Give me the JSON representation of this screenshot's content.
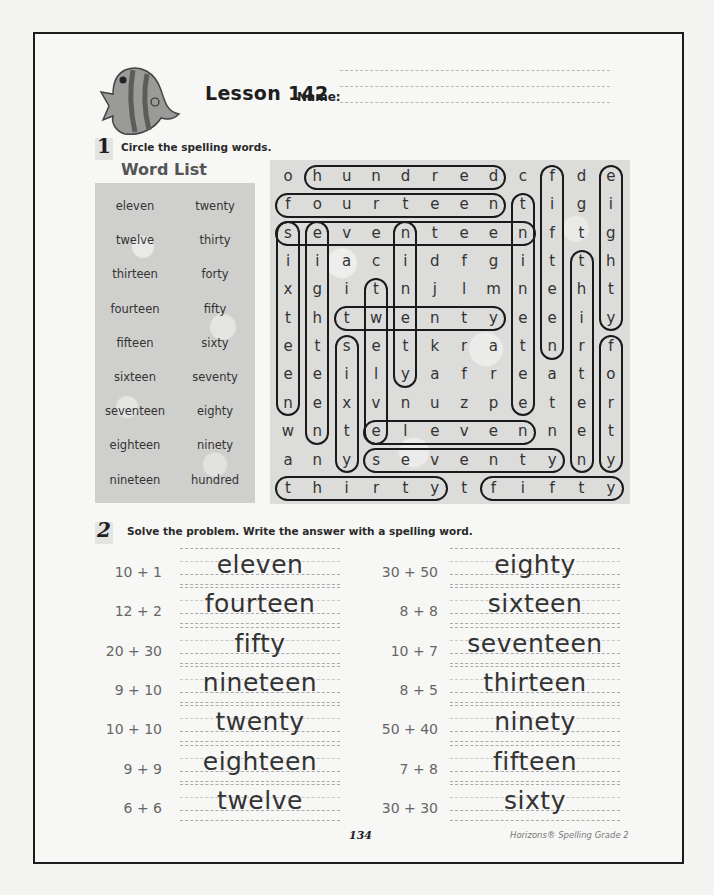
{
  "header": {
    "lesson_title": "Lesson 142",
    "name_label": "Name:",
    "mascot": "fish-icon"
  },
  "section1": {
    "number": "1",
    "instruction": "Circle the spelling words.",
    "word_list_title": "Word List",
    "word_list": [
      [
        "eleven",
        "twenty"
      ],
      [
        "twelve",
        "thirty"
      ],
      [
        "thirteen",
        "forty"
      ],
      [
        "fourteen",
        "fifty"
      ],
      [
        "fifteen",
        "sixty"
      ],
      [
        "sixteen",
        "seventy"
      ],
      [
        "seventeen",
        "eighty"
      ],
      [
        "eighteen",
        "ninety"
      ],
      [
        "nineteen",
        "hundred"
      ]
    ],
    "grid": [
      [
        "o",
        "h",
        "u",
        "n",
        "d",
        "r",
        "e",
        "d",
        "c",
        "f",
        "d",
        "e"
      ],
      [
        "f",
        "o",
        "u",
        "r",
        "t",
        "e",
        "e",
        "n",
        "t",
        "i",
        "g",
        "i"
      ],
      [
        "s",
        "e",
        "v",
        "e",
        "n",
        "t",
        "e",
        "e",
        "n",
        "f",
        "t",
        "g"
      ],
      [
        "i",
        "i",
        "a",
        "c",
        "i",
        "d",
        "f",
        "g",
        "i",
        "t",
        "t",
        "h"
      ],
      [
        "x",
        "g",
        "i",
        "t",
        "n",
        "j",
        "l",
        "m",
        "n",
        "e",
        "h",
        "t"
      ],
      [
        "t",
        "h",
        "t",
        "w",
        "e",
        "n",
        "t",
        "y",
        "e",
        "e",
        "i",
        "y"
      ],
      [
        "e",
        "t",
        "s",
        "e",
        "t",
        "k",
        "r",
        "a",
        "t",
        "n",
        "r",
        "f"
      ],
      [
        "e",
        "e",
        "i",
        "l",
        "y",
        "a",
        "f",
        "r",
        "e",
        "a",
        "t",
        "o"
      ],
      [
        "n",
        "e",
        "x",
        "v",
        "n",
        "u",
        "z",
        "p",
        "e",
        "t",
        "e",
        "r"
      ],
      [
        "w",
        "n",
        "t",
        "e",
        "l",
        "e",
        "v",
        "e",
        "n",
        "n",
        "e",
        "t"
      ],
      [
        "a",
        "n",
        "y",
        "s",
        "e",
        "v",
        "e",
        "n",
        "t",
        "y",
        "n",
        "y"
      ],
      [
        "t",
        "h",
        "i",
        "r",
        "t",
        "y",
        "t",
        "f",
        "i",
        "f",
        "t",
        "y"
      ]
    ],
    "circled_words": [
      {
        "word": "hundred",
        "dir": "h",
        "row": 0,
        "start": 1,
        "end": 7
      },
      {
        "word": "fourteen",
        "dir": "h",
        "row": 1,
        "start": 0,
        "end": 7
      },
      {
        "word": "seventeen",
        "dir": "h",
        "row": 2,
        "start": 0,
        "end": 8
      },
      {
        "word": "twenty",
        "dir": "h",
        "row": 5,
        "start": 2,
        "end": 7
      },
      {
        "word": "eleven",
        "dir": "h",
        "row": 9,
        "start": 3,
        "end": 8
      },
      {
        "word": "seventy",
        "dir": "h",
        "row": 10,
        "start": 3,
        "end": 9
      },
      {
        "word": "thirty",
        "dir": "h",
        "row": 11,
        "start": 0,
        "end": 5
      },
      {
        "word": "fifty",
        "dir": "h",
        "row": 11,
        "start": 7,
        "end": 11
      },
      {
        "word": "sixteen",
        "dir": "v",
        "col": 0,
        "start": 2,
        "end": 8
      },
      {
        "word": "eighteen",
        "dir": "v",
        "col": 1,
        "start": 2,
        "end": 9
      },
      {
        "word": "sixty",
        "dir": "v",
        "col": 2,
        "start": 6,
        "end": 10
      },
      {
        "word": "twelve",
        "dir": "v",
        "col": 3,
        "start": 4,
        "end": 9
      },
      {
        "word": "ninety",
        "dir": "v",
        "col": 4,
        "start": 2,
        "end": 7
      },
      {
        "word": "nineteen",
        "dir": "v",
        "col": 8,
        "start": 1,
        "end": 8
      },
      {
        "word": "fifteen",
        "dir": "v",
        "col": 9,
        "start": 0,
        "end": 6
      },
      {
        "word": "thirteen",
        "dir": "v",
        "col": 10,
        "start": 3,
        "end": 10
      },
      {
        "word": "eighty",
        "dir": "v",
        "col": 11,
        "start": 0,
        "end": 5
      },
      {
        "word": "forty",
        "dir": "v",
        "col": 11,
        "start": 6,
        "end": 10
      }
    ]
  },
  "section2": {
    "number": "2",
    "instruction": "Solve the problem. Write the answer with a spelling word.",
    "left": [
      {
        "problem": "10 + 1",
        "answer": "eleven"
      },
      {
        "problem": "12 + 2",
        "answer": "fourteen"
      },
      {
        "problem": "20 + 30",
        "answer": "fifty"
      },
      {
        "problem": "9 + 10",
        "answer": "nineteen"
      },
      {
        "problem": "10 + 10",
        "answer": "twenty"
      },
      {
        "problem": "9 + 9",
        "answer": "eighteen"
      },
      {
        "problem": "6 + 6",
        "answer": "twelve"
      }
    ],
    "right": [
      {
        "problem": "30 + 50",
        "answer": "eighty"
      },
      {
        "problem": "8 + 8",
        "answer": "sixteen"
      },
      {
        "problem": "10 + 7",
        "answer": "seventeen"
      },
      {
        "problem": "8 + 5",
        "answer": "thirteen"
      },
      {
        "problem": "50 + 40",
        "answer": "ninety"
      },
      {
        "problem": "7 + 8",
        "answer": "fifteen"
      },
      {
        "problem": "30 + 30",
        "answer": "sixty"
      }
    ]
  },
  "footer": {
    "page_number": "134",
    "publisher": "Horizons® Spelling Grade 2"
  }
}
